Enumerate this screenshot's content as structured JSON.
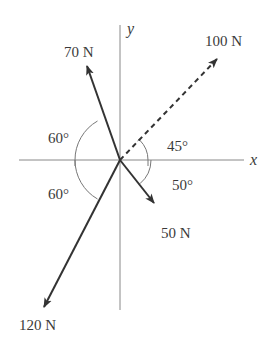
{
  "diagram": {
    "type": "force-vector-diagram",
    "axes": {
      "x_label": "x",
      "y_label": "y"
    },
    "forces": [
      {
        "label": "70N",
        "magnitude": "70 N",
        "angle_label": "60°",
        "reference": "negative x-axis",
        "quadrant": "II",
        "style": "solid"
      },
      {
        "label": "100N",
        "magnitude": "100 N",
        "angle_label": "45°",
        "reference": "positive x-axis",
        "quadrant": "I",
        "style": "dashed"
      },
      {
        "label": "50N",
        "magnitude": "50 N",
        "angle_label": "50°",
        "reference": "positive x-axis",
        "quadrant": "IV",
        "style": "solid"
      },
      {
        "label": "120N",
        "magnitude": "120 N",
        "angle_label": "60°",
        "reference": "negative x-axis",
        "quadrant": "III",
        "style": "solid"
      }
    ],
    "labels": {
      "f70": "70 N",
      "f100": "100 N",
      "f50": "50 N",
      "f120": "120 N",
      "a70": "60°",
      "a100": "45°",
      "a50": "50°",
      "a120": "60°"
    },
    "colors": {
      "axis": "#888888",
      "vector": "#333333",
      "text": "#3a3a3a"
    }
  }
}
